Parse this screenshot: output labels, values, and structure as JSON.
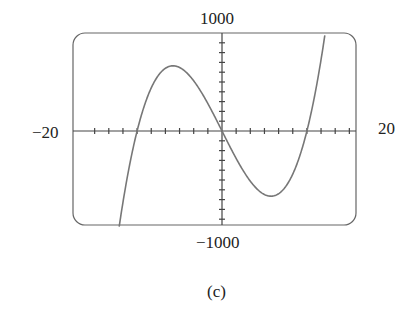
{
  "chart_data": {
    "type": "line",
    "title": "",
    "caption": "(c)",
    "xlabel": "",
    "ylabel": "",
    "xlim": [
      -20,
      20
    ],
    "ylim": [
      -1000,
      1000
    ],
    "x_tick_labels": {
      "min": "−20",
      "max": "20"
    },
    "y_tick_labels": {
      "max": "1000",
      "min": "−1000"
    },
    "x_tick_step": 2,
    "y_tick_step": 100,
    "grid": false,
    "series": [
      {
        "name": "f(x)",
        "x": [
          -15,
          -14,
          -13,
          -12,
          -11,
          -10,
          -9,
          -8,
          -7,
          -6,
          -5,
          -4,
          -3,
          -2,
          -1,
          0,
          1,
          2,
          3,
          4,
          5,
          6,
          7,
          8,
          9,
          10,
          11,
          12,
          13,
          14,
          15,
          16,
          17
        ],
        "values": [
          -1215,
          -728,
          -325,
          0,
          253,
          440,
          567,
          640,
          665,
          648,
          595,
          512,
          405,
          280,
          143,
          0,
          -143,
          -280,
          -405,
          -512,
          -595,
          -648,
          -665,
          -640,
          -567,
          -440,
          -253,
          0,
          325,
          728,
          1215,
          1792,
          2465
        ]
      }
    ],
    "roots": [
      -12,
      0,
      12
    ],
    "local_max": {
      "x": -7,
      "y": 665
    },
    "local_min": {
      "x": 7,
      "y": -665
    }
  },
  "labels": {
    "y_top": "1000",
    "y_bottom": "−1000",
    "x_left": "−20",
    "x_right": "20",
    "caption": "(c)"
  }
}
